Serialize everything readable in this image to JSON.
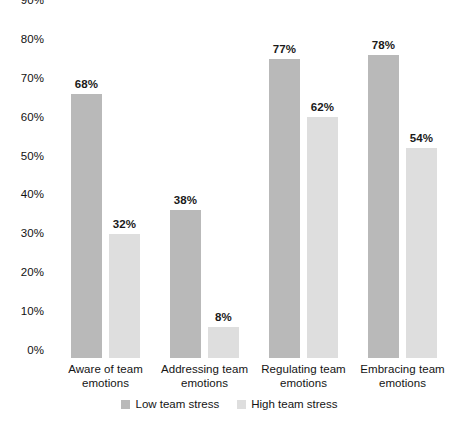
{
  "chart_data": {
    "type": "bar",
    "title": "",
    "subtitle": "",
    "xlabel": "",
    "ylabel": "",
    "ylim": [
      0,
      90
    ],
    "ytick_step": 10,
    "grid": false,
    "legend_position": "bottom",
    "value_label_format": "percent",
    "categories": [
      "Aware of team emotions",
      "Addressing team emotions",
      "Regulating team emotions",
      "Embracing team emotions"
    ],
    "category_lines": [
      [
        "Aware of team",
        "emotions"
      ],
      [
        "Addressing team",
        "emotions"
      ],
      [
        "Regulating team",
        "emotions"
      ],
      [
        "Embracing team",
        "emotions"
      ]
    ],
    "series": [
      {
        "name": "Low team stress",
        "color": "#b9b9b9",
        "values": [
          68,
          38,
          77,
          78
        ],
        "labels": [
          "68%",
          "38%",
          "77%",
          "78%"
        ]
      },
      {
        "name": "High team stress",
        "color": "#dedede",
        "values": [
          32,
          8,
          62,
          54
        ],
        "labels": [
          "32%",
          "8%",
          "62%",
          "54%"
        ]
      }
    ],
    "ytick_labels": [
      "90%",
      "80%",
      "70%",
      "60%",
      "50%",
      "40%",
      "30%",
      "20%",
      "10%",
      "0%"
    ],
    "ytick_values": [
      90,
      80,
      70,
      60,
      50,
      40,
      30,
      20,
      10,
      0
    ]
  },
  "legend": {
    "items": [
      {
        "label": "Low team stress",
        "color": "#b9b9b9"
      },
      {
        "label": "High team stress",
        "color": "#dedede"
      }
    ]
  }
}
